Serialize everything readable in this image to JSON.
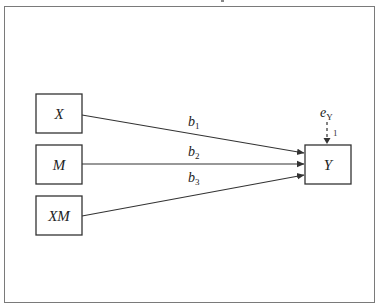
{
  "diagram": {
    "type": "path-diagram",
    "nodes": [
      {
        "id": "X",
        "label": "X",
        "role": "predictor"
      },
      {
        "id": "M",
        "label": "M",
        "role": "moderator"
      },
      {
        "id": "XM",
        "label": "XM",
        "role": "interaction"
      },
      {
        "id": "Y",
        "label": "Y",
        "role": "outcome"
      }
    ],
    "edges": [
      {
        "from": "X",
        "to": "Y",
        "coef": "b",
        "sub": "1"
      },
      {
        "from": "M",
        "to": "Y",
        "coef": "b",
        "sub": "2"
      },
      {
        "from": "XM",
        "to": "Y",
        "coef": "b",
        "sub": "3"
      }
    ],
    "error_term": {
      "label": "e",
      "sub": "Y",
      "target": "Y",
      "fixed_loading": "1",
      "line_style": "dashed"
    }
  },
  "colors": {
    "frame": "#7a7a7a",
    "stroke": "#333333",
    "text": "#222222",
    "background": "#ffffff"
  }
}
